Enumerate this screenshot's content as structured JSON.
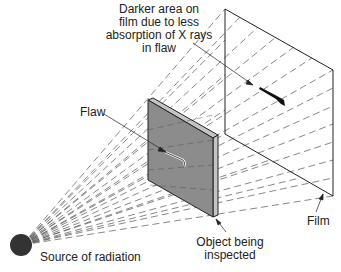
{
  "diagram": {
    "labels": {
      "darker_area_lines": [
        "Darker area on",
        "film due to less",
        "absorption of X rays",
        "in flaw"
      ],
      "flaw": "Flaw",
      "object_lines": [
        "Object being",
        "inspected"
      ],
      "film": "Film",
      "source": "Source of radiation"
    },
    "colors": {
      "slab_front": "#8c8c8c",
      "slab_edge": "#c4c4c4",
      "source": "#333333",
      "line": "#222222"
    }
  }
}
